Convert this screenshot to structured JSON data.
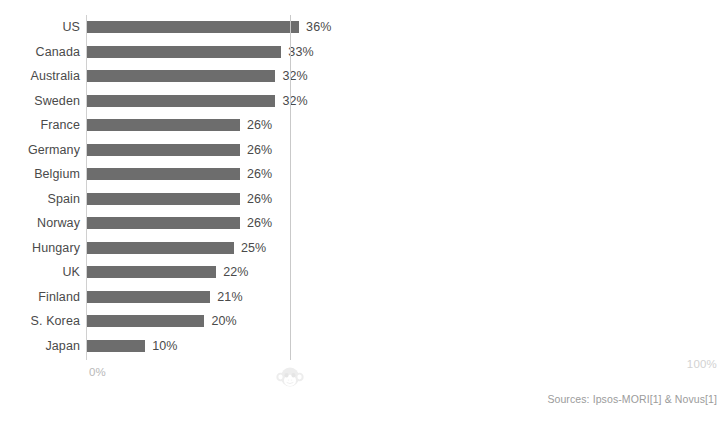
{
  "chart_data": {
    "type": "bar",
    "orientation": "horizontal",
    "title": "",
    "subtitle": "",
    "xlabel": "",
    "ylabel": "",
    "xlim": [
      0,
      100
    ],
    "grid": true,
    "gridlines_at": [
      50
    ],
    "legend": "none",
    "categories": [
      "US",
      "Canada",
      "Australia",
      "Sweden",
      "France",
      "Germany",
      "Belgium",
      "Spain",
      "Norway",
      "Hungary",
      "UK",
      "Finland",
      "S. Korea",
      "Japan"
    ],
    "values": [
      36,
      33,
      32,
      32,
      26,
      26,
      26,
      26,
      26,
      25,
      22,
      21,
      20,
      10
    ],
    "value_labels": [
      "36%",
      "33%",
      "32%",
      "32%",
      "26%",
      "26%",
      "26%",
      "26%",
      "26%",
      "25%",
      "22%",
      "21%",
      "20%",
      "10%"
    ],
    "bar_color": "#6d6d6d",
    "axis_min_label": "0%",
    "axis_max_label": "100%",
    "axis_line_color": "#d0d0d0",
    "gridline_color": "#c9c9c9",
    "label_color": "#4a4a4a",
    "background": "#ffffff"
  },
  "footer": {
    "sources": "Sources: Ipsos-MORI[1] & Novus[1]"
  },
  "watermark": {
    "name": "monkey-face-logo",
    "color": "#d8d8d8"
  }
}
